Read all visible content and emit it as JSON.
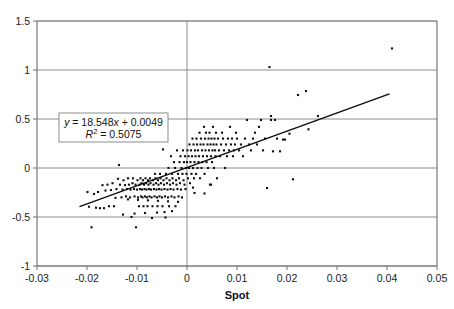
{
  "figure": {
    "kind": "scatter-plot-with-trendline",
    "background": "#ffffff",
    "plot_area_px": {
      "left": 37,
      "top": 21,
      "right": 437,
      "bottom": 266
    }
  },
  "axis": {
    "x_title": "Spot",
    "x_ticks": [
      "-0.03",
      "-0.02",
      "-0.01",
      "0",
      "0.01",
      "0.02",
      "0.03",
      "0.04",
      "0.05"
    ],
    "y_ticks": [
      "1.5",
      "1",
      "0.5",
      "0",
      "-0.5",
      "-1"
    ],
    "x_min": -0.03,
    "x_max": 0.05,
    "y_min": -1,
    "y_max": 1.5
  },
  "annotation": {
    "equation_y": "y",
    "equation_eq": " = 18.548",
    "equation_x": "x",
    "equation_tail": " + 0.0049",
    "r2_symbol": "R",
    "r2_sup": "2",
    "r2_value": " = 0.5075",
    "slope": 18.548,
    "intercept": 0.0049,
    "r_squared": 0.5075,
    "box_border_color": "#808080"
  },
  "style": {
    "gridline_color": "#808080",
    "axis_color": "#6e6e6e",
    "marker_color": "#101010",
    "trendline_color": "#0d0d0d",
    "marker_size_px": 2.1
  },
  "chart_data": {
    "type": "scatter",
    "title": "",
    "xlabel": "Spot",
    "ylabel": "",
    "xlim": [
      -0.03,
      0.05
    ],
    "ylim": [
      -1,
      1.5
    ],
    "xticks": [
      -0.03,
      -0.02,
      -0.01,
      0,
      0.01,
      0.02,
      0.03,
      0.04,
      0.05
    ],
    "yticks": [
      -1,
      -0.5,
      0,
      0.5,
      1,
      1.5
    ],
    "grid": "horizontal-and-zero-vertical",
    "legend": "none",
    "trendline": {
      "equation": "y = 18.548x + 0.0049",
      "r_squared": 0.5075,
      "slope": 18.548,
      "intercept": 0.0049,
      "x_start": -0.0215,
      "x_end": 0.0405
    },
    "series": [
      {
        "name": "Spot vs Return",
        "marker": "square",
        "color": "#101010",
        "points": [
          [
            -0.0199,
            -0.245
          ],
          [
            -0.0196,
            -0.395
          ],
          [
            -0.0191,
            -0.605
          ],
          [
            -0.0186,
            -0.265
          ],
          [
            -0.0182,
            -0.405
          ],
          [
            -0.0178,
            -0.245
          ],
          [
            -0.0174,
            -0.41
          ],
          [
            -0.0169,
            -0.175
          ],
          [
            -0.0166,
            -0.41
          ],
          [
            -0.0163,
            -0.23
          ],
          [
            -0.0159,
            -0.17
          ],
          [
            -0.0156,
            -0.39
          ],
          [
            -0.0152,
            -0.225
          ],
          [
            -0.0149,
            -0.155
          ],
          [
            -0.0146,
            -0.39
          ],
          [
            -0.0143,
            -0.305
          ],
          [
            -0.0141,
            -0.215
          ],
          [
            -0.0138,
            -0.11
          ],
          [
            -0.0136,
            0.03
          ],
          [
            -0.0134,
            -0.17
          ],
          [
            -0.0131,
            -0.3
          ],
          [
            -0.0129,
            -0.22
          ],
          [
            -0.0127,
            -0.125
          ],
          [
            -0.0124,
            -0.175
          ],
          [
            -0.0122,
            -0.29
          ],
          [
            -0.012,
            -0.215
          ],
          [
            -0.0118,
            -0.105
          ],
          [
            -0.0116,
            -0.17
          ],
          [
            -0.0114,
            -0.3
          ],
          [
            -0.0113,
            -0.22
          ],
          [
            -0.0111,
            -0.5
          ],
          [
            -0.0109,
            -0.155
          ],
          [
            -0.0108,
            -0.105
          ],
          [
            -0.0106,
            -0.215
          ],
          [
            -0.0105,
            -0.29
          ],
          [
            -0.0103,
            -0.17
          ],
          [
            -0.0102,
            -0.605
          ],
          [
            -0.01,
            -0.22
          ],
          [
            -0.0099,
            -0.125
          ],
          [
            -0.0098,
            -0.3
          ],
          [
            -0.0096,
            -0.39
          ],
          [
            -0.0095,
            -0.17
          ],
          [
            -0.0094,
            -0.215
          ],
          [
            -0.0093,
            -0.105
          ],
          [
            -0.0092,
            -0.29
          ],
          [
            -0.0091,
            -0.155
          ],
          [
            -0.009,
            -0.22
          ],
          [
            -0.0089,
            -0.3
          ],
          [
            -0.0088,
            -0.125
          ],
          [
            -0.0087,
            -0.39
          ],
          [
            -0.0086,
            -0.17
          ],
          [
            -0.0085,
            -0.215
          ],
          [
            -0.0084,
            -0.29
          ],
          [
            -0.0083,
            -0.105
          ],
          [
            -0.0082,
            -0.155
          ],
          [
            -0.0081,
            -0.22
          ],
          [
            -0.008,
            -0.3
          ],
          [
            -0.0079,
            -0.39
          ],
          [
            -0.0078,
            -0.125
          ],
          [
            -0.0077,
            -0.17
          ],
          [
            -0.0076,
            -0.215
          ],
          [
            -0.0075,
            -0.29
          ],
          [
            -0.0074,
            -0.105
          ],
          [
            -0.0073,
            -0.155
          ],
          [
            -0.0072,
            -0.22
          ],
          [
            -0.0071,
            -0.3
          ],
          [
            -0.007,
            -0.51
          ],
          [
            -0.0069,
            -0.39
          ],
          [
            -0.0068,
            -0.125
          ],
          [
            -0.0067,
            -0.17
          ],
          [
            -0.0066,
            -0.215
          ],
          [
            -0.0065,
            -0.29
          ],
          [
            -0.0064,
            -0.06
          ],
          [
            -0.0063,
            -0.105
          ],
          [
            -0.0062,
            -0.155
          ],
          [
            -0.0061,
            -0.22
          ],
          [
            -0.006,
            -0.3
          ],
          [
            -0.0059,
            -0.39
          ],
          [
            -0.0058,
            -0.125
          ],
          [
            -0.0057,
            -0.17
          ],
          [
            -0.0056,
            -0.215
          ],
          [
            -0.0055,
            -0.29
          ],
          [
            -0.0054,
            -0.06
          ],
          [
            -0.0053,
            -0.105
          ],
          [
            -0.0052,
            -0.155
          ],
          [
            -0.0051,
            -0.22
          ],
          [
            -0.005,
            -0.3
          ],
          [
            -0.0049,
            -0.39
          ],
          [
            -0.0048,
            0.19
          ],
          [
            -0.0047,
            -0.125
          ],
          [
            -0.0046,
            -0.17
          ],
          [
            -0.0045,
            -0.215
          ],
          [
            -0.0044,
            -0.29
          ],
          [
            -0.0043,
            -0.505
          ],
          [
            -0.0042,
            -0.06
          ],
          [
            -0.0041,
            -0.105
          ],
          [
            -0.004,
            -0.155
          ],
          [
            -0.0039,
            -0.22
          ],
          [
            -0.0038,
            -0.3
          ],
          [
            -0.0037,
            0.0
          ],
          [
            -0.0036,
            -0.39
          ],
          [
            -0.0035,
            -0.125
          ],
          [
            -0.0034,
            -0.17
          ],
          [
            -0.0033,
            -0.215
          ],
          [
            -0.0032,
            0.12
          ],
          [
            -0.0031,
            -0.29
          ],
          [
            -0.003,
            -0.06
          ],
          [
            -0.0029,
            -0.105
          ],
          [
            -0.0028,
            -0.155
          ],
          [
            -0.0027,
            -0.22
          ],
          [
            -0.0026,
            0.06
          ],
          [
            -0.0025,
            -0.3
          ],
          [
            -0.0024,
            0.0
          ],
          [
            -0.0023,
            -0.39
          ],
          [
            -0.0022,
            -0.125
          ],
          [
            -0.0021,
            -0.17
          ],
          [
            -0.002,
            0.18
          ],
          [
            -0.0019,
            -0.215
          ],
          [
            -0.0018,
            -0.06
          ],
          [
            -0.0017,
            -0.29
          ],
          [
            -0.0016,
            -0.105
          ],
          [
            -0.0015,
            0.06
          ],
          [
            -0.0014,
            -0.155
          ],
          [
            -0.0013,
            0.12
          ],
          [
            -0.0012,
            -0.22
          ],
          [
            -0.0011,
            0.0
          ],
          [
            -0.001,
            -0.3
          ],
          [
            -0.0009,
            -0.06
          ],
          [
            -0.0008,
            0.18
          ],
          [
            -0.0007,
            -0.125
          ],
          [
            -0.0006,
            0.06
          ],
          [
            -0.0005,
            -0.17
          ],
          [
            -0.0004,
            0.12
          ],
          [
            -0.0003,
            -0.215
          ],
          [
            -0.0002,
            0.0
          ],
          [
            -0.0001,
            -0.06
          ],
          [
            0.0,
            0.06
          ],
          [
            0.0001,
            0.18
          ],
          [
            0.0002,
            -0.105
          ],
          [
            0.0003,
            0.12
          ],
          [
            0.0004,
            0.0
          ],
          [
            0.0005,
            0.24
          ],
          [
            0.0006,
            -0.155
          ],
          [
            0.0007,
            0.06
          ],
          [
            0.0008,
            0.18
          ],
          [
            0.0009,
            -0.06
          ],
          [
            0.001,
            0.12
          ],
          [
            0.0011,
            0.3
          ],
          [
            0.0012,
            0.0
          ],
          [
            0.0013,
            0.24
          ],
          [
            0.0014,
            -0.105
          ],
          [
            0.0015,
            0.06
          ],
          [
            0.0016,
            0.18
          ],
          [
            0.0017,
            0.12
          ],
          [
            0.0018,
            -0.06
          ],
          [
            0.0019,
            0.3
          ],
          [
            0.002,
            0.24
          ],
          [
            0.0021,
            0.0
          ],
          [
            0.0022,
            0.18
          ],
          [
            0.0023,
            0.06
          ],
          [
            0.0024,
            0.12
          ],
          [
            0.0025,
            0.36
          ],
          [
            0.0026,
            -0.105
          ],
          [
            0.0027,
            0.24
          ],
          [
            0.0028,
            0.3
          ],
          [
            0.0029,
            0.0
          ],
          [
            0.003,
            0.18
          ],
          [
            0.0031,
            0.06
          ],
          [
            0.0032,
            0.12
          ],
          [
            0.0033,
            0.24
          ],
          [
            0.0034,
            0.42
          ],
          [
            0.0035,
            -0.06
          ],
          [
            0.0036,
            0.3
          ],
          [
            0.0037,
            0.18
          ],
          [
            0.0038,
            0.36
          ],
          [
            0.0039,
            0.06
          ],
          [
            0.004,
            0.12
          ],
          [
            0.0041,
            0.24
          ],
          [
            0.0042,
            0.0
          ],
          [
            0.0043,
            0.3
          ],
          [
            0.0044,
            0.18
          ],
          [
            0.0045,
            0.36
          ],
          [
            0.0046,
            -0.17
          ],
          [
            0.0047,
            0.24
          ],
          [
            0.0048,
            0.12
          ],
          [
            0.0049,
            0.3
          ],
          [
            0.005,
            0.06
          ],
          [
            0.0051,
            0.18
          ],
          [
            0.0052,
            0.42
          ],
          [
            0.0053,
            0.24
          ],
          [
            0.0054,
            0.0
          ],
          [
            0.0055,
            0.3
          ],
          [
            0.0056,
            0.18
          ],
          [
            0.0057,
            0.12
          ],
          [
            0.0058,
            0.36
          ],
          [
            0.0059,
            0.24
          ],
          [
            0.006,
            -0.105
          ],
          [
            0.0062,
            0.3
          ],
          [
            0.0064,
            0.18
          ],
          [
            0.0066,
            0.12
          ],
          [
            0.0068,
            0.24
          ],
          [
            0.007,
            0.36
          ],
          [
            0.0072,
            0.3
          ],
          [
            0.0074,
            0.18
          ],
          [
            0.0076,
            0.0
          ],
          [
            0.0078,
            0.24
          ],
          [
            0.008,
            0.12
          ],
          [
            0.0082,
            0.3
          ],
          [
            0.0084,
            0.18
          ],
          [
            0.0086,
            0.42
          ],
          [
            0.0088,
            0.24
          ],
          [
            0.009,
            0.3
          ],
          [
            0.0092,
            0.12
          ],
          [
            0.0094,
            0.18
          ],
          [
            0.0096,
            0.24
          ],
          [
            0.0098,
            0.36
          ],
          [
            0.01,
            0.3
          ],
          [
            0.0104,
            0.18
          ],
          [
            0.0108,
            0.24
          ],
          [
            0.0112,
            0.12
          ],
          [
            0.0116,
            0.3
          ],
          [
            0.012,
            0.49
          ],
          [
            0.0124,
            0.24
          ],
          [
            0.0128,
            0.18
          ],
          [
            0.0132,
            0.3
          ],
          [
            0.0136,
            0.36
          ],
          [
            0.014,
            0.24
          ],
          [
            0.0144,
            0.42
          ],
          [
            0.0148,
            0.49
          ],
          [
            0.0152,
            0.18
          ],
          [
            0.0156,
            0.3
          ],
          [
            0.016,
            -0.205
          ],
          [
            0.0165,
            1.03
          ],
          [
            0.0168,
            0.53
          ],
          [
            0.0168,
            0.49
          ],
          [
            0.0172,
            0.17
          ],
          [
            0.0176,
            0.49
          ],
          [
            0.018,
            0.3
          ],
          [
            0.0186,
            0.17
          ],
          [
            0.0192,
            0.29
          ],
          [
            0.0196,
            0.29
          ],
          [
            0.0205,
            0.35
          ],
          [
            0.0212,
            -0.115
          ],
          [
            0.0222,
            0.745
          ],
          [
            0.0238,
            0.785
          ],
          [
            0.0243,
            0.395
          ],
          [
            0.0262,
            0.53
          ],
          [
            0.041,
            1.22
          ],
          [
            -0.0128,
            -0.475
          ],
          [
            -0.0105,
            -0.465
          ],
          [
            -0.0084,
            -0.46
          ],
          [
            -0.006,
            -0.455
          ],
          [
            -0.0045,
            -0.45
          ],
          [
            -0.003,
            -0.44
          ],
          [
            0.0015,
            -0.255
          ],
          [
            0.0035,
            -0.26
          ],
          [
            0.0048,
            -0.17
          ],
          [
            0.0012,
            -0.2
          ],
          [
            -0.0018,
            -0.345
          ],
          [
            -0.0038,
            -0.34
          ],
          [
            -0.0058,
            -0.335
          ],
          [
            -0.0078,
            -0.33
          ],
          [
            -0.0098,
            -0.325
          ],
          [
            -0.0118,
            -0.32
          ]
        ]
      }
    ]
  }
}
